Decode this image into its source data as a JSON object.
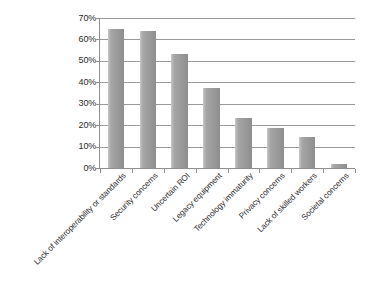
{
  "chart_data": {
    "type": "bar",
    "title": "",
    "subtitle": "",
    "xlabel": "",
    "ylabel": "",
    "orientation": "vertical",
    "grid": true,
    "legend": false,
    "legend_position": "none",
    "ylim": [
      0,
      70
    ],
    "ytick_labels": [
      "70%",
      "60%",
      "50%",
      "40%",
      "30%",
      "20%",
      "10%",
      "0%"
    ],
    "ytick_values": [
      70,
      60,
      50,
      40,
      30,
      20,
      10,
      0
    ],
    "value_suffix": "%",
    "bar_color": "#9b9b9b",
    "gridline_color": "#9a9a9a",
    "axis_color": "#8f8f8f",
    "background_color": "#ffffff",
    "categories": [
      "Lack of interoperability or standards",
      "Security concerns",
      "Uncertain ROI",
      "Legacy equipment",
      "Technology immaturity",
      "Privacy concerns",
      "Lack of skilled workers",
      "Societal concerns"
    ],
    "values": [
      65,
      64,
      53,
      37.5,
      23.5,
      18.5,
      14.5,
      2
    ]
  }
}
